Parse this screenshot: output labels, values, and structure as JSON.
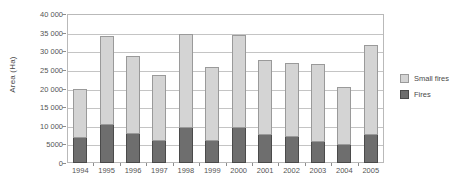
{
  "chart_data": {
    "type": "bar",
    "stacked": true,
    "title": "",
    "xlabel": "",
    "ylabel": "Area (Ha)",
    "ylim": [
      0,
      40000
    ],
    "ytick_labels": [
      "40 000",
      "35 000",
      "30 000",
      "25 000",
      "20 000",
      "15 000",
      "10 000",
      "5000",
      "0"
    ],
    "ytick_values": [
      40000,
      35000,
      30000,
      25000,
      20000,
      15000,
      10000,
      5000,
      0
    ],
    "grid": true,
    "legend_position": "right",
    "categories": [
      "1994",
      "1995",
      "1996",
      "1997",
      "1998",
      "1999",
      "2000",
      "2001",
      "2002",
      "2003",
      "2004",
      "2005"
    ],
    "series": [
      {
        "name": "Fires",
        "color": "#6e6e6e",
        "values": [
          6700,
          10200,
          7900,
          5800,
          9300,
          6000,
          9400,
          7400,
          6900,
          5700,
          4900,
          7600
        ]
      },
      {
        "name": "Small fires",
        "color": "#d4d4d4",
        "values": [
          13300,
          24000,
          20900,
          17900,
          25400,
          19700,
          25100,
          20300,
          20000,
          20900,
          15600,
          24100
        ]
      }
    ],
    "totals": [
      20000,
      34200,
      28800,
      23700,
      34700,
      25700,
      34500,
      27700,
      26900,
      26600,
      20500,
      31700
    ]
  },
  "legend": {
    "items": [
      {
        "label": "Small fires",
        "color": "#d4d4d4"
      },
      {
        "label": "Fires",
        "color": "#6e6e6e"
      }
    ]
  }
}
